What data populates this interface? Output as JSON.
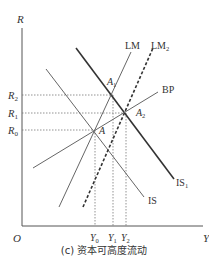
{
  "diagram": {
    "caption": "(c) 资本可高度流动",
    "axes": {
      "y_label": "R",
      "x_label": "Y",
      "origin_label": "O"
    },
    "y_ticks": [
      {
        "label": "R",
        "sub": "2"
      },
      {
        "label": "R",
        "sub": "1"
      },
      {
        "label": "R",
        "sub": "0"
      }
    ],
    "x_ticks": [
      {
        "label": "Y",
        "sub": "0"
      },
      {
        "label": "Y",
        "sub": "1"
      },
      {
        "label": "Y",
        "sub": "2"
      }
    ],
    "curves": {
      "lm": {
        "label": "LM",
        "sub": ""
      },
      "lm2": {
        "label": "LM",
        "sub": "2"
      },
      "bp": {
        "label": "BP",
        "sub": ""
      },
      "is": {
        "label": "IS",
        "sub": ""
      },
      "is1": {
        "label": "IS",
        "sub": "1"
      }
    },
    "points": {
      "a": {
        "label": "A",
        "sub": ""
      },
      "a1": {
        "label": "A",
        "sub": "1"
      },
      "a2": {
        "label": "A",
        "sub": "2"
      }
    },
    "colors": {
      "axis": "#555555",
      "line": "#555555",
      "bold_line": "#333333",
      "dotted": "#777777",
      "text": "#333333"
    }
  }
}
